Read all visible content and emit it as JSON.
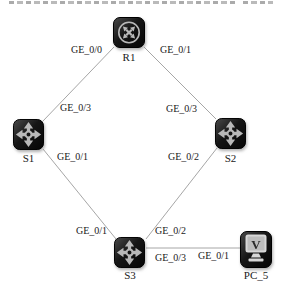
{
  "canvas": {
    "width": 282,
    "height": 289,
    "background": "#ffffff"
  },
  "colors": {
    "link": "#a6a6a6",
    "label_text": "#1a1a1a",
    "device_body_dark": "#0b0b0b",
    "device_body_light": "#474747",
    "device_glyph": "#b9b9b9",
    "pc_screen_fill": "#bdbdbd",
    "pc_screen_border": "#d8d8d8",
    "pc_glyph_color": "#2a2a2a"
  },
  "devices": [
    {
      "id": "R1",
      "label": "R1",
      "type": "router",
      "x": 113,
      "y": 17,
      "w": 32,
      "h": 31,
      "label_y": 51
    },
    {
      "id": "S1",
      "label": "S1",
      "type": "switch",
      "x": 13,
      "y": 119,
      "w": 31,
      "h": 31,
      "label_y": 152
    },
    {
      "id": "S2",
      "label": "S2",
      "type": "switch",
      "x": 215,
      "y": 118,
      "w": 31,
      "h": 31,
      "label_y": 152
    },
    {
      "id": "S3",
      "label": "S3",
      "type": "switch",
      "x": 114,
      "y": 237,
      "w": 32,
      "h": 31,
      "label_y": 269
    },
    {
      "id": "PC_5",
      "label": "PC_5",
      "type": "pc",
      "x": 240,
      "y": 231,
      "w": 32,
      "h": 37,
      "label_y": 269
    }
  ],
  "links": [
    {
      "from": "R1",
      "to": "S1",
      "x1": 114,
      "y1": 47,
      "x2": 43,
      "y2": 121
    },
    {
      "from": "R1",
      "to": "S2",
      "x1": 144,
      "y1": 47,
      "x2": 216,
      "y2": 119
    },
    {
      "from": "S1",
      "to": "S3",
      "x1": 43,
      "y1": 149,
      "x2": 116,
      "y2": 239
    },
    {
      "from": "S2",
      "to": "S3",
      "x1": 217,
      "y1": 148,
      "x2": 146,
      "y2": 239
    },
    {
      "from": "S3",
      "to": "PC_5",
      "x1": 146,
      "y1": 248,
      "x2": 241,
      "y2": 248
    }
  ],
  "port_labels": [
    {
      "text": "GE_0/0",
      "x": 71,
      "y": 44
    },
    {
      "text": "GE_0/1",
      "x": 160,
      "y": 44
    },
    {
      "text": "GE_0/3",
      "x": 60,
      "y": 102
    },
    {
      "text": "GE_0/3",
      "x": 166,
      "y": 103
    },
    {
      "text": "GE_0/1",
      "x": 57,
      "y": 151
    },
    {
      "text": "GE_0/2",
      "x": 168,
      "y": 151
    },
    {
      "text": "GE_0/1",
      "x": 76,
      "y": 225
    },
    {
      "text": "GE_0/2",
      "x": 155,
      "y": 225
    },
    {
      "text": "GE_0/3",
      "x": 155,
      "y": 252
    },
    {
      "text": "GE_0/1",
      "x": 198,
      "y": 250
    }
  ],
  "pc_screen_glyph": "V"
}
